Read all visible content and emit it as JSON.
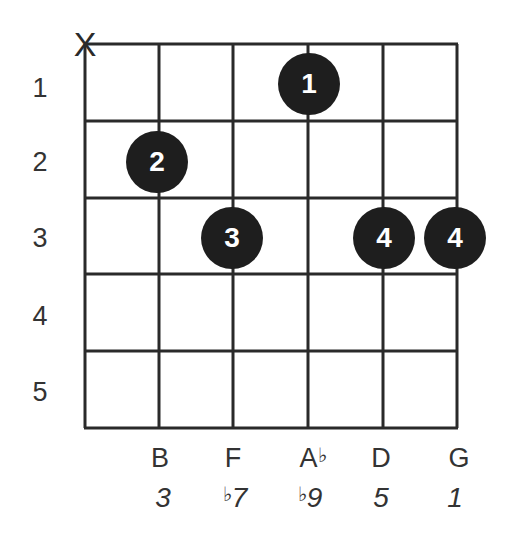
{
  "chord_diagram": {
    "muted_string_marker": "X",
    "fret_numbers": [
      "1",
      "2",
      "3",
      "4",
      "5"
    ],
    "fingers": [
      {
        "string": 4,
        "fret": 1,
        "finger": "1"
      },
      {
        "string": 2,
        "fret": 2,
        "finger": "2"
      },
      {
        "string": 3,
        "fret": 3,
        "finger": "3"
      },
      {
        "string": 5,
        "fret": 3,
        "finger": "4"
      },
      {
        "string": 6,
        "fret": 3,
        "finger": "4"
      }
    ],
    "notes": [
      {
        "note": "B",
        "accidental": "",
        "interval": "3",
        "interval_accidental": ""
      },
      {
        "note": "F",
        "accidental": "",
        "interval": "7",
        "interval_accidental": "♭"
      },
      {
        "note": "A",
        "accidental": "♭",
        "interval": "9",
        "interval_accidental": "♭"
      },
      {
        "note": "D",
        "accidental": "",
        "interval": "5",
        "interval_accidental": ""
      },
      {
        "note": "G",
        "accidental": "",
        "interval": "1",
        "interval_accidental": ""
      }
    ],
    "colors": {
      "dot": "#1e1e1e",
      "line": "#2a2a2a",
      "text": "#333333"
    }
  }
}
